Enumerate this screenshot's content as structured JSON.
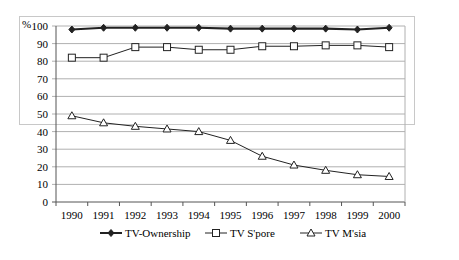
{
  "chart_data": {
    "type": "line",
    "title": "",
    "xlabel": "",
    "ylabel": "%",
    "ylim": [
      0,
      100
    ],
    "yticks": [
      0,
      10,
      20,
      30,
      40,
      50,
      60,
      70,
      80,
      90,
      100
    ],
    "grid": true,
    "legend_position": "bottom",
    "categories": [
      "1990",
      "1991",
      "1992",
      "1993",
      "1994",
      "1995",
      "1996",
      "1997",
      "1998",
      "1999",
      "2000"
    ],
    "series": [
      {
        "name": "TV-Ownership",
        "marker": "filled-diamond",
        "values": [
          98,
          99,
          99,
          99,
          99,
          98.5,
          98.5,
          98.5,
          98.5,
          98,
          99
        ]
      },
      {
        "name": "TV S'pore",
        "marker": "open-square",
        "values": [
          82,
          82,
          88,
          88,
          86.5,
          86.5,
          88.5,
          88.5,
          89,
          89,
          88
        ]
      },
      {
        "name": "TV M'sia",
        "marker": "open-triangle",
        "values": [
          49,
          45,
          43,
          41.5,
          40,
          35,
          26,
          21,
          18,
          15.5,
          14.5
        ]
      }
    ]
  },
  "colors": {
    "line": "#222222",
    "grid": "#b0b0b0",
    "frame": "#c8c8c8"
  }
}
